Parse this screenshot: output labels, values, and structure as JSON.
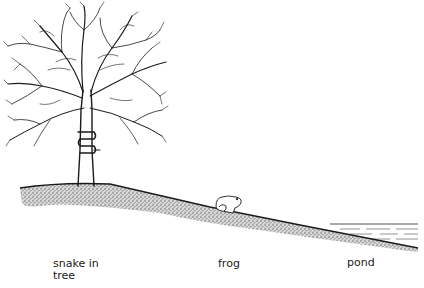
{
  "diagram": {
    "labels": {
      "snake": "snake in\ntree",
      "frog": "frog",
      "pond": "pond"
    },
    "elements": [
      {
        "name": "tree",
        "icon": "tree-icon"
      },
      {
        "name": "snake",
        "icon": "snake-icon",
        "location": "coiled around tree trunk"
      },
      {
        "name": "frog",
        "icon": "frog-icon",
        "location": "middle of slope"
      },
      {
        "name": "pond",
        "icon": "water-icon",
        "location": "bottom right of slope"
      },
      {
        "name": "ground",
        "icon": "hill-slope-icon"
      }
    ],
    "colors": {
      "ink": "#1a1a1a",
      "stipple": "#6b6b6b",
      "background": "#ffffff"
    }
  }
}
